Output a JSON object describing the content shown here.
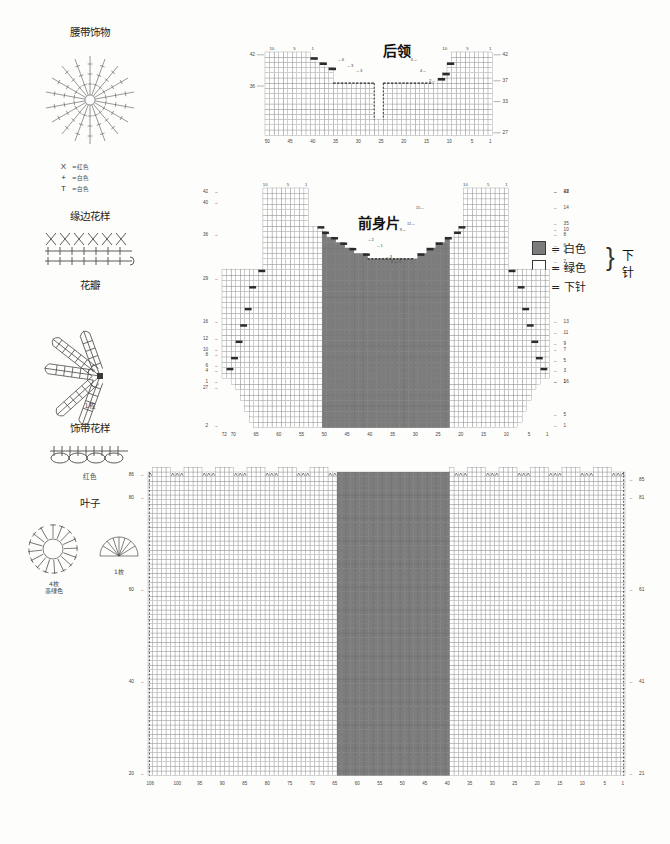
{
  "meta": {
    "doc_kind": "knitting-chart-sheet",
    "colors": {
      "dark_cell": "#7c7c7c",
      "light_cell": "#ffffff",
      "grid_line": "#5a5a5a",
      "ink": "#2b2b2b"
    }
  },
  "sidebar": {
    "sections": [
      {
        "id": "belt-ornament",
        "title": "腰带饰物",
        "sub": "",
        "legend": [
          {
            "symbol": "X",
            "icon": "crochet-x-icon",
            "text": "=红色"
          },
          {
            "symbol": "+",
            "icon": "crochet-plus-icon",
            "text": "=白色"
          },
          {
            "symbol": "T",
            "icon": "crochet-treble-icon",
            "text": "=白色"
          }
        ]
      },
      {
        "id": "edge-pattern",
        "title": "缘边花样",
        "sub": ""
      },
      {
        "id": "petal",
        "title": "花瓣",
        "sub": "1枚"
      },
      {
        "id": "ribbon-pattern",
        "title": "饰带花样",
        "sub": "红色"
      },
      {
        "id": "leaf",
        "title": "叶子",
        "sub_left": "4枚",
        "sub_left2": "墨绿色",
        "sub_right": "1枚"
      }
    ]
  },
  "legend": {
    "rows": [
      {
        "swatch": "dark",
        "text": "= 白色"
      },
      {
        "swatch": "light",
        "text": "= 绿色"
      },
      {
        "swatch": "knit",
        "text": "= 下针"
      }
    ],
    "brace_text": "下针",
    "brace_glyph": "}"
  },
  "charts": [
    {
      "id": "back-collar",
      "title": "后领",
      "cols": 50,
      "rows": 16,
      "bottom_ticks": [
        {
          "v": "50",
          "col": 50
        },
        {
          "v": "45",
          "col": 45
        },
        {
          "v": "40",
          "col": 40
        },
        {
          "v": "35",
          "col": 35
        },
        {
          "v": "30",
          "col": 30
        },
        {
          "v": "25",
          "col": 25
        },
        {
          "v": "20",
          "col": 20
        },
        {
          "v": "15",
          "col": 15
        },
        {
          "v": "10",
          "col": 10
        },
        {
          "v": "5",
          "col": 5
        },
        {
          "v": "1",
          "col": 1
        }
      ],
      "top_ticks_left": [
        {
          "v": "10",
          "col": 49
        },
        {
          "v": "5",
          "col": 44
        },
        {
          "v": "1",
          "col": 40
        }
      ],
      "top_ticks_right": [
        {
          "v": "10",
          "col": 11
        },
        {
          "v": "5",
          "col": 6
        },
        {
          "v": "1",
          "col": 1
        }
      ],
      "left_rows": [
        {
          "v": "42",
          "row": 16
        },
        {
          "v": "36",
          "row": 10
        }
      ],
      "right_rows": [
        {
          "v": "42",
          "row": 16
        },
        {
          "v": "37",
          "row": 11
        },
        {
          "v": "33",
          "row": 7
        },
        {
          "v": "27",
          "row": 1
        }
      ],
      "notes_left": [
        {
          "v": "6",
          "row": 15
        },
        {
          "v": "3",
          "row": 14
        },
        {
          "v": "3",
          "row": 13
        }
      ],
      "notes_right": [
        {
          "v": "6",
          "row": 15
        },
        {
          "v": "4",
          "row": 13
        },
        {
          "v": "2",
          "row": 11
        }
      ]
    },
    {
      "id": "front-body",
      "title": "前身片",
      "cols": 72,
      "rows": 44,
      "bottom_ticks": [
        {
          "v": "72",
          "col": 72
        },
        {
          "v": "70",
          "col": 70
        },
        {
          "v": "65",
          "col": 65
        },
        {
          "v": "60",
          "col": 60
        },
        {
          "v": "55",
          "col": 55
        },
        {
          "v": "50",
          "col": 50
        },
        {
          "v": "45",
          "col": 45
        },
        {
          "v": "40",
          "col": 40
        },
        {
          "v": "35",
          "col": 35
        },
        {
          "v": "30",
          "col": 30
        },
        {
          "v": "25",
          "col": 25
        },
        {
          "v": "20",
          "col": 20
        },
        {
          "v": "15",
          "col": 15
        },
        {
          "v": "10",
          "col": 10
        },
        {
          "v": "5",
          "col": 5
        },
        {
          "v": "1",
          "col": 1
        }
      ],
      "top_ticks_left": [
        {
          "v": "10",
          "col": 63
        },
        {
          "v": "5",
          "col": 58
        },
        {
          "v": "1",
          "col": 54
        }
      ],
      "top_ticks_right": [
        {
          "v": "10",
          "col": 19
        },
        {
          "v": "5",
          "col": 14
        },
        {
          "v": "1",
          "col": 10
        }
      ],
      "left_rows": [
        {
          "v": "42",
          "row": 44
        },
        {
          "v": "40",
          "row": 42
        },
        {
          "v": "36",
          "row": 36
        },
        {
          "v": "29",
          "row": 28
        },
        {
          "v": "16",
          "row": 20
        },
        {
          "v": "12",
          "row": 17
        },
        {
          "v": "10",
          "row": 15
        },
        {
          "v": "8",
          "row": 14
        },
        {
          "v": "6",
          "row": 12
        },
        {
          "v": "4",
          "row": 11
        },
        {
          "v": "1",
          "row": 9
        },
        {
          "v": "27",
          "row": 8
        },
        {
          "v": "2",
          "row": 1
        }
      ],
      "right_rows": [
        {
          "v": "18",
          "row": 44
        },
        {
          "v": "14",
          "row": 41
        },
        {
          "v": "10",
          "row": 37
        },
        {
          "v": "8",
          "row": 36
        },
        {
          "v": "6",
          "row": 34
        },
        {
          "v": "4",
          "row": 33
        },
        {
          "v": "2",
          "row": 31
        },
        {
          "v": "42",
          "row": 44
        },
        {
          "v": "35",
          "row": 38
        },
        {
          "v": "25",
          "row": 30
        },
        {
          "v": "13",
          "row": 20
        },
        {
          "v": "11",
          "row": 18
        },
        {
          "v": "9",
          "row": 16
        },
        {
          "v": "7",
          "row": 15
        },
        {
          "v": "5",
          "row": 13
        },
        {
          "v": "3",
          "row": 11
        },
        {
          "v": "1",
          "row": 9
        },
        {
          "v": "16",
          "row": 9
        },
        {
          "v": "5",
          "row": 3
        },
        {
          "v": "1",
          "row": 1
        }
      ],
      "neck_notes_left": [
        {
          "v": "6",
          "row": 37
        },
        {
          "v": "2",
          "row": 35
        },
        {
          "v": "1",
          "row": 34
        },
        {
          "v": "3",
          "row": 32
        },
        {
          "v": "1",
          "row": 31
        }
      ],
      "neck_notes_right": [
        {
          "v": "15",
          "row": 41
        },
        {
          "v": "11",
          "row": 38
        },
        {
          "v": "9",
          "row": 37
        },
        {
          "v": "2",
          "row": 31
        }
      ]
    },
    {
      "id": "back-body",
      "title": "",
      "cols": 106,
      "rows": 66,
      "bottom_ticks": [
        {
          "v": "106",
          "col": 106
        },
        {
          "v": "100",
          "col": 100
        },
        {
          "v": "95",
          "col": 95
        },
        {
          "v": "90",
          "col": 90
        },
        {
          "v": "85",
          "col": 85
        },
        {
          "v": "80",
          "col": 80
        },
        {
          "v": "75",
          "col": 75
        },
        {
          "v": "70",
          "col": 70
        },
        {
          "v": "65",
          "col": 65
        },
        {
          "v": "60",
          "col": 60
        },
        {
          "v": "55",
          "col": 55
        },
        {
          "v": "50",
          "col": 50
        },
        {
          "v": "45",
          "col": 45
        },
        {
          "v": "40",
          "col": 40
        },
        {
          "v": "35",
          "col": 35
        },
        {
          "v": "30",
          "col": 30
        },
        {
          "v": "25",
          "col": 25
        },
        {
          "v": "20",
          "col": 20
        },
        {
          "v": "15",
          "col": 15
        },
        {
          "v": "10",
          "col": 10
        },
        {
          "v": "5",
          "col": 5
        },
        {
          "v": "1",
          "col": 1
        }
      ],
      "left_rows": [
        {
          "v": "86",
          "row": 66
        },
        {
          "v": "80",
          "row": 61
        },
        {
          "v": "60",
          "row": 41
        },
        {
          "v": "40",
          "row": 21
        },
        {
          "v": "20",
          "row": 1
        }
      ],
      "right_rows": [
        {
          "v": "85",
          "row": 65
        },
        {
          "v": "81",
          "row": 61
        },
        {
          "v": "61",
          "row": 41
        },
        {
          "v": "41",
          "row": 21
        },
        {
          "v": "21",
          "row": 1
        }
      ]
    }
  ],
  "chart_data": {
    "type": "heatmap",
    "legend": [
      "白色 (dark swatch)",
      "绿色 (light swatch)",
      "下针 (knit)"
    ],
    "grids": [
      {
        "name": "后领",
        "cols": 50,
        "rows": 16,
        "xlabel": "针数",
        "ylabel": "行数",
        "xticks": [
          50,
          45,
          40,
          35,
          30,
          25,
          20,
          15,
          10,
          5,
          1
        ],
        "yticks": [
          42,
          36,
          33,
          27
        ],
        "fill": "light",
        "shape": "stepped-collar-with-center-notch"
      },
      {
        "name": "前身片",
        "cols": 72,
        "rows": 44,
        "xlabel": "针数",
        "ylabel": "行数",
        "xticks": [
          72,
          70,
          65,
          60,
          55,
          50,
          45,
          40,
          35,
          30,
          25,
          20,
          15,
          10,
          5,
          1
        ],
        "yticks": [
          42,
          40,
          36,
          29,
          27,
          25,
          16,
          13,
          12,
          11,
          10,
          9,
          8,
          7,
          6,
          5,
          4,
          3,
          2,
          1
        ],
        "dark_band_cols": [
          23,
          50
        ],
        "shape": "v-neck-vest-front-with-armholes"
      },
      {
        "name": "后身片",
        "cols": 106,
        "rows": 66,
        "xlabel": "针数",
        "ylabel": "行数",
        "xticks": [
          106,
          100,
          95,
          90,
          85,
          80,
          75,
          70,
          65,
          60,
          55,
          50,
          45,
          40,
          35,
          30,
          25,
          20,
          15,
          10,
          5,
          1
        ],
        "yticks": [
          86,
          85,
          81,
          80,
          61,
          60,
          41,
          40,
          21,
          20
        ],
        "dark_band_cols": [
          40,
          64
        ],
        "shape": "rectangular-body-with-center-panel"
      }
    ]
  }
}
